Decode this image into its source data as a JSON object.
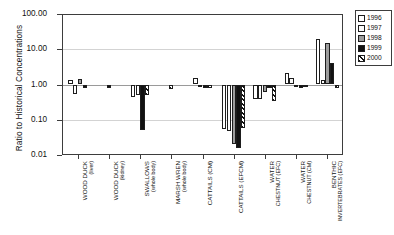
{
  "chart_data": {
    "type": "bar",
    "title": "",
    "xlabel": "",
    "ylabel": "Ratio to Historical Concentrations",
    "yscale": "log",
    "ylim": [
      0.01,
      100.0
    ],
    "ytick_labels": [
      "100.00",
      "10.00",
      "1.00",
      "0.10",
      "0.01"
    ],
    "ytick_values": [
      100.0,
      10.0,
      1.0,
      0.1,
      0.01
    ],
    "grid": true,
    "reference_line": 1.0,
    "legend_position": "top-right",
    "categories": [
      "WOOD DUCK (liver)",
      "WOOD DUCK (kidney)",
      "SWALLOWS (whole body)",
      "MARSH WREN (whole body)",
      "CATTAILS (CM)",
      "CATTAILS (EFCM)",
      "WATER CHESTNUT (EFC)",
      "WATER CHESTNUT (CM)",
      "BENTHIC INVERTEBRATES (EFC)"
    ],
    "category_lines": [
      [
        "WOOD DUCK",
        "(liver)"
      ],
      [
        "WOOD DUCK",
        "(kidney)"
      ],
      [
        "SWALLOWS",
        "(whole body)"
      ],
      [
        "MARSH WREN",
        "(whole body)"
      ],
      [
        "CATTAILS (CM)",
        ""
      ],
      [
        "CATTAILS (EFCM)",
        ""
      ],
      [
        "WATER",
        "CHESTNUT (EFC)"
      ],
      [
        "WATER",
        "CHESTNUT (CM)"
      ],
      [
        "BENTHIC",
        "INVERTEBRATES (EFC)"
      ]
    ],
    "series": [
      {
        "name": "1996",
        "color": "#ffffff",
        "pattern": "solid",
        "values": [
          1.3,
          null,
          0.45,
          null,
          1.55,
          0.055,
          0.38,
          2.1,
          20.0
        ]
      },
      {
        "name": "1997",
        "color": "#fbfbfb",
        "pattern": "solid",
        "values": [
          0.55,
          null,
          0.5,
          null,
          0.92,
          0.048,
          0.4,
          1.55,
          1.3
        ]
      },
      {
        "name": "1998",
        "color": "#9d9d9d",
        "pattern": "solid",
        "values": [
          1.45,
          null,
          null,
          null,
          null,
          0.02,
          0.62,
          0.9,
          15.0
        ]
      },
      {
        "name": "1999",
        "color": "#111111",
        "pattern": "solid",
        "values": [
          0.78,
          0.8,
          0.052,
          null,
          0.8,
          0.016,
          0.8,
          0.8,
          4.0
        ]
      },
      {
        "name": "2000",
        "color": "#111111",
        "pattern": "hatched",
        "values": [
          null,
          null,
          0.5,
          0.75,
          0.78,
          0.06,
          0.33,
          0.85,
          0.8
        ]
      }
    ]
  },
  "legend": {
    "items": [
      {
        "label": "1996",
        "swatch": "sw-1996"
      },
      {
        "label": "1997",
        "swatch": "sw-1997"
      },
      {
        "label": "1998",
        "swatch": "sw-1998"
      },
      {
        "label": "1999",
        "swatch": "sw-1999"
      },
      {
        "label": "2000",
        "swatch": "sw-2000"
      }
    ]
  }
}
